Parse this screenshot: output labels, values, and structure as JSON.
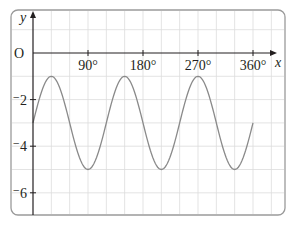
{
  "chart_data": {
    "type": "line",
    "title": "",
    "xlabel": "x",
    "ylabel": "y",
    "origin_label": "O",
    "x_ticks": [
      90,
      180,
      270,
      360
    ],
    "x_tick_labels": [
      "90°",
      "180°",
      "270°",
      "360°"
    ],
    "y_ticks": [
      -2,
      -4,
      -6
    ],
    "y_tick_labels": [
      "⁻2",
      "⁻4",
      "⁻6"
    ],
    "xlim": [
      0,
      360
    ],
    "ylim": [
      -7,
      1.5
    ],
    "grid": true,
    "grid_x_step": 30,
    "grid_y_step": 1,
    "function": "y = 2 sin(3x) - 3",
    "series": [
      {
        "name": "curve",
        "x": [
          0,
          30,
          60,
          90,
          120,
          150,
          180,
          210,
          240,
          270,
          300,
          330,
          360
        ],
        "values": [
          -3,
          -1,
          -3,
          -5,
          -3,
          -1,
          -3,
          -5,
          -3,
          -1,
          -3,
          -5,
          -3
        ]
      }
    ],
    "colors": {
      "curve": "#888888",
      "axes": "#231f20",
      "grid": "#d9d9d9",
      "frame": "#999999"
    }
  }
}
